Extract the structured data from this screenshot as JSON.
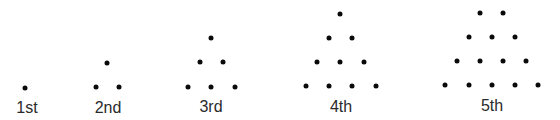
{
  "figures": [
    {
      "label": "1st",
      "label_pos": [
        27,
        108
      ],
      "dots": [
        [
          25,
          88
        ]
      ]
    },
    {
      "label": "2nd",
      "label_pos": [
        108,
        108
      ],
      "dots": [
        [
          107,
          63
        ],
        [
          96,
          87
        ],
        [
          119,
          87
        ]
      ]
    },
    {
      "label": "3rd",
      "label_pos": [
        211,
        107
      ],
      "dots": [
        [
          211,
          38
        ],
        [
          200,
          62
        ],
        [
          223,
          62
        ],
        [
          188,
          87
        ],
        [
          211,
          87
        ],
        [
          235,
          87
        ]
      ]
    },
    {
      "label": "4th",
      "label_pos": [
        341,
        107
      ],
      "dots": [
        [
          340,
          14
        ],
        [
          329,
          38
        ],
        [
          352,
          38
        ],
        [
          317,
          62
        ],
        [
          340,
          62
        ],
        [
          364,
          62
        ],
        [
          306,
          86
        ],
        [
          329,
          86
        ],
        [
          352,
          86
        ],
        [
          376,
          86
        ]
      ]
    },
    {
      "label": "5th",
      "label_pos": [
        492,
        106
      ],
      "dots": [
        [
          480,
          13
        ],
        [
          503,
          13
        ],
        [
          469,
          37
        ],
        [
          492,
          37
        ],
        [
          515,
          37
        ],
        [
          457,
          61
        ],
        [
          480,
          61
        ],
        [
          503,
          61
        ],
        [
          526,
          61
        ],
        [
          445,
          85
        ],
        [
          469,
          85
        ],
        [
          492,
          85
        ],
        [
          515,
          85
        ],
        [
          538,
          85
        ]
      ]
    }
  ],
  "colors": {
    "dot": "#0a0a0a",
    "label": "#2a2a2a",
    "background": "#ffffff"
  }
}
